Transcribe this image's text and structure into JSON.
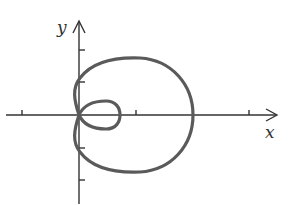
{
  "figure": {
    "axis_labels": {
      "x": "x",
      "y": "y"
    },
    "x_ticks_count_each_side": 2,
    "y_ticks_count_each_side": 2,
    "colors": {
      "axis": "#333333",
      "curve": "#555555",
      "background": "#ffffff"
    }
  }
}
